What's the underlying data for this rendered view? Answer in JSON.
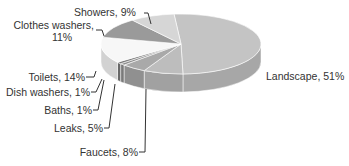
{
  "chart_data": {
    "type": "pie",
    "style": "3d-grayscale",
    "title": "",
    "categories": [
      "Landscape",
      "Faucets",
      "Leaks",
      "Baths",
      "Dish washers",
      "Toilets",
      "Clothes washers",
      "Showers"
    ],
    "values": [
      51,
      8,
      5,
      1,
      1,
      14,
      11,
      9
    ],
    "unit": "%",
    "labels": [
      {
        "text": "Landscape, 51%"
      },
      {
        "text": "Faucets, 8%"
      },
      {
        "text": "Leaks, 5%"
      },
      {
        "text": "Baths, 1%"
      },
      {
        "text": "Dish washers, 1%"
      },
      {
        "text": "Toilets, 14%"
      },
      {
        "text": "Clothes washers,",
        "text2": "11%"
      },
      {
        "text": "Showers, 9%"
      }
    ],
    "legend": "none (callout labels)",
    "colors": [
      "#c4c4c4",
      "#bdbdbd",
      "#a9a9a9",
      "#8f8f8f",
      "#7a7a7a",
      "#f7f7f7",
      "#9a9a9a",
      "#d6d6d6"
    ]
  }
}
